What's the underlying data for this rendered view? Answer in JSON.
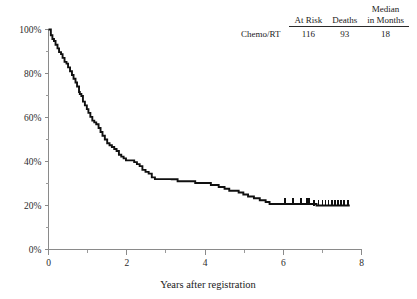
{
  "chart_data": {
    "type": "line",
    "subtype": "kaplan-meier-step",
    "title": "",
    "xlabel": "Years after registration",
    "ylabel": "",
    "xlim": [
      0,
      8
    ],
    "ylim": [
      0,
      100
    ],
    "grid": false,
    "legend_position": "top-right",
    "x_ticks_major": [
      0,
      2,
      4,
      6,
      8
    ],
    "x_tick_labels": [
      "0",
      "2",
      "4",
      "6",
      "8"
    ],
    "x_ticks_minor": [
      1,
      3,
      5,
      7
    ],
    "y_ticks_major": [
      0,
      20,
      40,
      60,
      80,
      100
    ],
    "y_tick_labels": [
      "0%",
      "20%",
      "40%",
      "60%",
      "80%",
      "100%"
    ],
    "y_ticks_minor": [
      10,
      30,
      50,
      70,
      90
    ],
    "series": [
      {
        "name": "Chemo/RT",
        "color": "#101010",
        "x": [
          0.0,
          0.06,
          0.1,
          0.14,
          0.18,
          0.23,
          0.27,
          0.32,
          0.36,
          0.41,
          0.46,
          0.5,
          0.55,
          0.6,
          0.64,
          0.69,
          0.73,
          0.78,
          0.8,
          0.84,
          0.88,
          0.93,
          0.98,
          1.02,
          1.07,
          1.12,
          1.17,
          1.22,
          1.28,
          1.33,
          1.38,
          1.44,
          1.5,
          1.56,
          1.62,
          1.68,
          1.74,
          1.8,
          1.86,
          1.92,
          1.98,
          2.05,
          2.12,
          2.19,
          2.26,
          2.33,
          2.4,
          2.48,
          2.56,
          2.64,
          2.72,
          3.0,
          3.15,
          3.3,
          3.55,
          3.75,
          3.95,
          4.15,
          4.35,
          4.5,
          4.62,
          4.74,
          4.86,
          4.98,
          5.1,
          5.25,
          5.4,
          5.55,
          5.65,
          6.55,
          6.62,
          6.72,
          6.85,
          7.0,
          7.7
        ],
        "y": [
          100.0,
          97.4,
          95.7,
          94.8,
          93.1,
          91.4,
          89.7,
          88.8,
          87.1,
          85.3,
          84.5,
          82.8,
          81.0,
          79.3,
          77.6,
          75.9,
          74.1,
          71.6,
          70.7,
          69.8,
          67.2,
          65.5,
          63.8,
          62.1,
          60.3,
          58.6,
          57.8,
          56.9,
          55.2,
          53.4,
          51.7,
          50.0,
          48.3,
          47.4,
          46.6,
          45.7,
          44.8,
          43.1,
          42.2,
          41.4,
          40.5,
          40.5,
          40.5,
          39.7,
          38.8,
          37.9,
          36.2,
          35.3,
          34.5,
          32.8,
          32.0,
          32.0,
          31.9,
          31.0,
          31.0,
          30.2,
          30.2,
          29.3,
          28.4,
          27.6,
          26.7,
          26.7,
          25.9,
          25.0,
          24.1,
          23.3,
          22.4,
          21.6,
          20.7,
          20.7,
          20.7,
          20.7,
          20.0,
          20.0,
          20.0
        ],
        "censored_x": [
          6.05,
          6.25,
          6.45,
          6.6,
          6.66,
          6.78,
          6.9,
          7.0,
          7.08,
          7.16,
          7.24,
          7.32,
          7.4,
          7.48,
          7.56,
          7.66
        ],
        "censored_y": [
          20.7,
          20.7,
          20.7,
          20.7,
          20.7,
          20.0,
          20.0,
          20.0,
          20.0,
          20.0,
          20.0,
          20.0,
          20.0,
          20.0,
          20.0,
          20.0
        ]
      }
    ]
  },
  "summary_table": {
    "columns": [
      "At Risk",
      "Deaths",
      "Median in Months"
    ],
    "column_lines": [
      [
        "At Risk"
      ],
      [
        "Deaths"
      ],
      [
        "Median",
        "in Months"
      ]
    ],
    "rows": [
      {
        "label": "Chemo/RT",
        "at_risk": "116",
        "deaths": "93",
        "median_months": "18"
      }
    ]
  },
  "colors": {
    "curve": "#101010",
    "axis": "#8a8a8a",
    "text": "#1a1a1a",
    "background": "#ffffff"
  }
}
